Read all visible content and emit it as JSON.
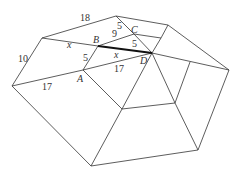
{
  "diagram": {
    "type": "polyhedron-net-projection",
    "vertices": {
      "L": [
        12,
        86
      ],
      "TL": [
        42,
        38
      ],
      "T": [
        116,
        16
      ],
      "TR": [
        168,
        25
      ],
      "R": [
        229,
        70
      ],
      "BR": [
        198,
        150
      ],
      "Bot": [
        91,
        166
      ],
      "A": [
        83,
        70
      ],
      "B": [
        98,
        46
      ],
      "C": [
        134,
        34
      ],
      "Cr": [
        161,
        38
      ],
      "D": [
        152,
        53
      ],
      "Rm": [
        190,
        62
      ],
      "IBL": [
        122,
        109
      ],
      "IBR": [
        175,
        103
      ]
    },
    "edges": [
      [
        "L",
        "TL"
      ],
      [
        "TL",
        "T"
      ],
      [
        "T",
        "TR"
      ],
      [
        "TR",
        "R"
      ],
      [
        "R",
        "BR"
      ],
      [
        "BR",
        "Bot"
      ],
      [
        "Bot",
        "L"
      ],
      [
        "TL",
        "B"
      ],
      [
        "L",
        "A"
      ],
      [
        "A",
        "D"
      ],
      [
        "A",
        "B"
      ],
      [
        "B",
        "C"
      ],
      [
        "T",
        "C"
      ],
      [
        "C",
        "D"
      ],
      [
        "C",
        "Cr"
      ],
      [
        "Cr",
        "TR"
      ],
      [
        "Cr",
        "D"
      ],
      [
        "D",
        "Rm"
      ],
      [
        "Rm",
        "R"
      ],
      [
        "D",
        "IBL"
      ],
      [
        "D",
        "IBR"
      ],
      [
        "A",
        "IBL"
      ],
      [
        "IBL",
        "IBR"
      ],
      [
        "IBL",
        "Bot"
      ],
      [
        "IBR",
        "BR"
      ],
      [
        "Rm",
        "IBR"
      ]
    ],
    "highlighted_edge": [
      "B",
      "D"
    ],
    "labels": {
      "A": "A",
      "B": "B",
      "C": "C",
      "D": "D",
      "top": "18",
      "left": "10",
      "bottom_left": "17",
      "ad": "17",
      "ab": "5",
      "bc": "9",
      "tc": "5",
      "cd": "5",
      "tlb": "x",
      "bd": "x"
    }
  }
}
